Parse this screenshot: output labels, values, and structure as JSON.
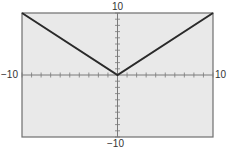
{
  "chart_data": {
    "type": "line",
    "title": "",
    "function": "y = |x|",
    "xlabel": "",
    "ylabel": "",
    "xlim": [
      -10,
      10
    ],
    "ylim": [
      -10,
      10
    ],
    "x_tick_step": 1,
    "y_tick_step": 1,
    "grid": false,
    "legend": null,
    "series": [
      {
        "name": "y = |x|",
        "x": [
          -10,
          0,
          10
        ],
        "y": [
          10,
          0,
          10
        ]
      }
    ],
    "tick_labels": {
      "x_min": "−10",
      "x_max": "10",
      "y_min": "−10",
      "y_max": "10"
    }
  },
  "colors": {
    "plot_background": "#e9e9e9",
    "frame": "#6e6e6e",
    "axis": "#7a7a7a",
    "line": "#2a2a2a"
  }
}
